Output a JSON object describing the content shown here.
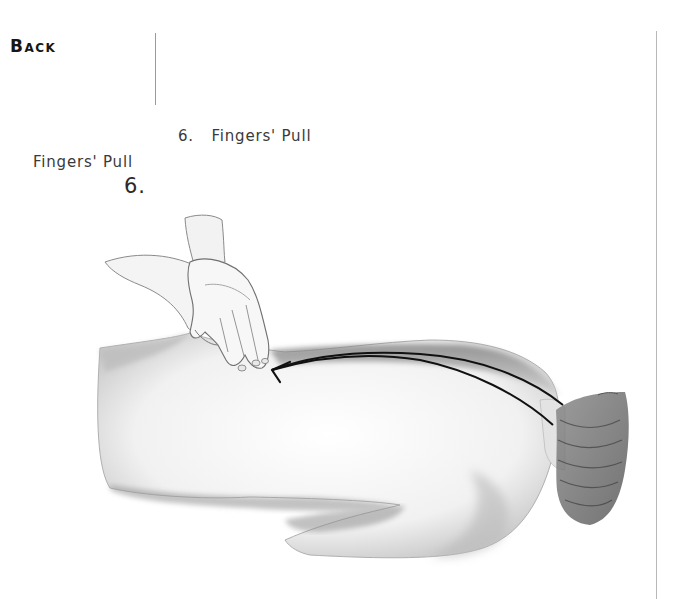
{
  "page": {
    "section_title": "Back",
    "figure": {
      "step_number": "6.",
      "step_title": "Fingers' Pull",
      "left_caption_title": "Fingers' Pull",
      "left_caption_number": "6.",
      "illustration_description": "Pencil drawing of hands performing a fingers' pull stroke on the back of a person lying face down, with an arrow showing the stroke direction from the neck toward the lower back",
      "arrow_direction": "neck-to-lower-back"
    },
    "colors": {
      "text": "#1a1a1a",
      "caption_text": "#3a3a3a",
      "rule": "#9a9a9a",
      "arrow": "#111111"
    }
  }
}
